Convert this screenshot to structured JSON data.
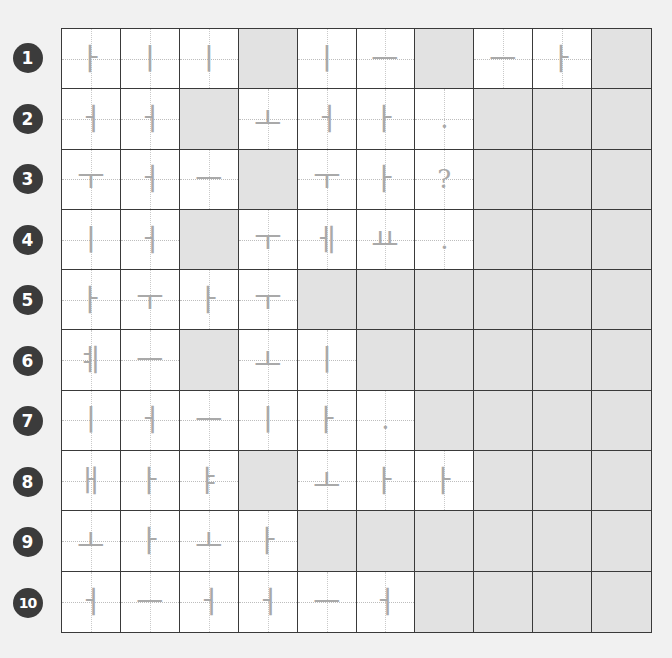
{
  "header": {
    "cut_off_text_left": "▁▁▁▁▁▁▁▁▁▁▁",
    "cut_off_text_right": "▁▁▁▁▁▁▁▁▁▁▁▁▁▁▁▁▁▁▁▁▁"
  },
  "colors": {
    "page_background": "#f1f1f1",
    "badge_background": "#3b3b3b",
    "badge_text": "#ffffff",
    "cell_background": "#ffffff",
    "shaded_cell": "#e2e2e2",
    "grid_line": "#3a3a3a",
    "guide_line": "#bdbdbd",
    "glyph": "#a9a9a9"
  },
  "worksheet": {
    "rows": [
      {
        "number": "1",
        "cells": [
          "ㅏ",
          "ㅣ",
          "ㅣ",
          "#",
          "ㅣ",
          "ㅡ",
          "#",
          "ㅡ",
          "ㅏ",
          "#"
        ]
      },
      {
        "number": "2",
        "cells": [
          "ㅓ",
          "ㅓ",
          "#",
          "ㅗ",
          "ㅓ",
          "ㅏ",
          ".",
          "#",
          "#",
          "#"
        ]
      },
      {
        "number": "3",
        "cells": [
          "ㅜ",
          "ㅓ",
          "ㅡ",
          "#",
          "ㅜ",
          "ㅏ",
          "?",
          "#",
          "#",
          "#"
        ]
      },
      {
        "number": "4",
        "cells": [
          "ㅣ",
          "ㅓ",
          "#",
          "ㅜ",
          "ㅔ",
          "ㅛ",
          ".",
          "#",
          "#",
          "#"
        ]
      },
      {
        "number": "5",
        "cells": [
          "ㅏ",
          "ㅜ",
          "ㅏ",
          "ㅜ",
          "#",
          "#",
          "#",
          "#",
          "#",
          "#"
        ]
      },
      {
        "number": "6",
        "cells": [
          "ㅖ",
          "ㅡ",
          "#",
          "ㅗ",
          "ㅣ",
          "#",
          "#",
          "#",
          "#",
          "#"
        ]
      },
      {
        "number": "7",
        "cells": [
          "ㅣ",
          "ㅓ",
          "ㅡ",
          "ㅣ",
          "ㅏ",
          ".",
          "#",
          "#",
          "#",
          "#"
        ]
      },
      {
        "number": "8",
        "cells": [
          "ㅐ",
          "ㅏ",
          "ㅑ",
          "#",
          "ㅗ",
          "ㅏ",
          "ㅏ",
          "#",
          "#",
          "#"
        ]
      },
      {
        "number": "9",
        "cells": [
          "ㅗ",
          "ㅏ",
          "ㅗ",
          "ㅏ",
          "#",
          "#",
          "#",
          "#",
          "#",
          "#"
        ]
      },
      {
        "number": "10",
        "cells": [
          "ㅓ",
          "ㅡ",
          "ㅓ",
          "ㅓ",
          "ㅡ",
          "ㅓ",
          "#",
          "#",
          "#",
          "#"
        ]
      }
    ],
    "shaded_marker": "#"
  }
}
